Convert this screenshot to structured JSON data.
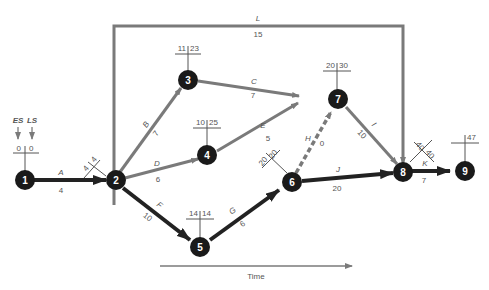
{
  "diagram": {
    "type": "pert-network",
    "legend": {
      "es_label": "ES",
      "ls_label": "LS"
    },
    "time_axis_label": "Time",
    "nodes": [
      {
        "id": "1",
        "es": "0",
        "ls": "0"
      },
      {
        "id": "2",
        "es": "4",
        "ls": "4"
      },
      {
        "id": "3",
        "es": "11",
        "ls": "23"
      },
      {
        "id": "4",
        "es": "10",
        "ls": "25"
      },
      {
        "id": "5",
        "es": "14",
        "ls": "14"
      },
      {
        "id": "6",
        "es": "20",
        "ls": "20"
      },
      {
        "id": "7",
        "es": "20",
        "ls": "30"
      },
      {
        "id": "8",
        "es": "40",
        "ls": "40"
      },
      {
        "id": "9",
        "es": "",
        "ls": "47"
      }
    ],
    "activities": [
      {
        "name": "A",
        "from": "1",
        "to": "2",
        "duration": "4",
        "critical": true
      },
      {
        "name": "B",
        "from": "2",
        "to": "3",
        "duration": "7",
        "critical": false
      },
      {
        "name": "C",
        "from": "3",
        "to": "7",
        "duration": "7",
        "critical": false
      },
      {
        "name": "D",
        "from": "2",
        "to": "4",
        "duration": "6",
        "critical": false
      },
      {
        "name": "E",
        "from": "4",
        "to": "7",
        "duration": "5",
        "critical": false
      },
      {
        "name": "F",
        "from": "2",
        "to": "5",
        "duration": "10",
        "critical": true
      },
      {
        "name": "G",
        "from": "5",
        "to": "6",
        "duration": "6",
        "critical": true
      },
      {
        "name": "H",
        "from": "6",
        "to": "7",
        "duration": "0",
        "critical": false,
        "dummy": true
      },
      {
        "name": "I",
        "from": "7",
        "to": "8",
        "duration": "10",
        "critical": false
      },
      {
        "name": "J",
        "from": "6",
        "to": "8",
        "duration": "20",
        "critical": true
      },
      {
        "name": "K",
        "from": "8",
        "to": "9",
        "duration": "7",
        "critical": true
      },
      {
        "name": "L",
        "from": "2",
        "to": "8",
        "duration": "15",
        "critical": false
      }
    ],
    "colors": {
      "critical": "#222222",
      "noncritical": "#7a7a7a",
      "node": "#1a1a1a"
    }
  }
}
